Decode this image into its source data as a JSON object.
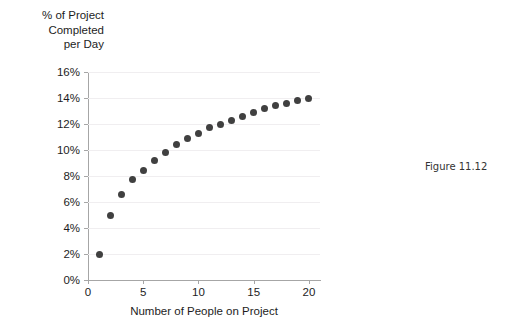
{
  "figure": {
    "caption": "Figure 11.12"
  },
  "chart_data": {
    "type": "scatter",
    "title": "",
    "ylabel": "% of Project\nCompleted\nper Day",
    "xlabel": "Number of People on Project",
    "xlim": [
      0,
      21
    ],
    "ylim": [
      0,
      16
    ],
    "xticks": [
      0,
      5,
      10,
      15,
      20
    ],
    "xtick_labels": [
      "0",
      "5",
      "10",
      "15",
      "20"
    ],
    "yticks": [
      0,
      2,
      4,
      6,
      8,
      10,
      12,
      14,
      16
    ],
    "ytick_labels": [
      "0%",
      "2%",
      "4%",
      "6%",
      "8%",
      "10%",
      "12%",
      "14%",
      "16%"
    ],
    "grid": false,
    "legend": "none",
    "marker_color": "#404040",
    "axis_color": "#a6a6a6",
    "x": [
      1,
      2,
      3,
      4,
      5,
      6,
      7,
      8,
      9,
      10,
      11,
      12,
      13,
      14,
      15,
      16,
      17,
      18,
      19,
      20
    ],
    "y": [
      2.0,
      5.0,
      6.6,
      7.7,
      8.4,
      9.2,
      9.8,
      10.4,
      10.9,
      11.3,
      11.7,
      12.0,
      12.3,
      12.6,
      12.9,
      13.2,
      13.4,
      13.6,
      13.8,
      14.0
    ],
    "series": [
      {
        "name": "Percent of project completed per day",
        "values": [
          2.0,
          5.0,
          6.6,
          7.7,
          8.4,
          9.2,
          9.8,
          10.4,
          10.9,
          11.3,
          11.7,
          12.0,
          12.3,
          12.6,
          12.9,
          13.2,
          13.4,
          13.6,
          13.8,
          14.0
        ]
      }
    ]
  }
}
